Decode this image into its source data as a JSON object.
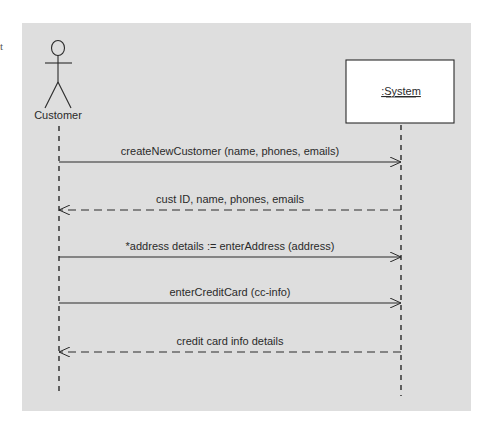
{
  "stray_text": "t",
  "actor": {
    "name": "Customer",
    "x": 59
  },
  "object": {
    "name": ":System",
    "x": 401
  },
  "messages": [
    {
      "label": "createNewCustomer (name, phones, emails)",
      "type": "sync",
      "direction": "right",
      "y": 162
    },
    {
      "label": "cust ID, name, phones, emails",
      "type": "return",
      "direction": "left",
      "y": 210
    },
    {
      "label": "*address details := enterAddress (address)",
      "type": "sync",
      "direction": "right",
      "y": 257
    },
    {
      "label": "enterCreditCard (cc-info)",
      "type": "sync",
      "direction": "right",
      "y": 303
    },
    {
      "label": "credit card info details",
      "type": "return",
      "direction": "left",
      "y": 352
    }
  ],
  "colors": {
    "background": "#dedede",
    "line": "#2a2a2a",
    "box_fill": "#ffffff"
  }
}
